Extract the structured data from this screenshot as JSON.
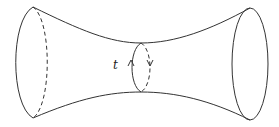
{
  "diagram": {
    "loop_label": "t",
    "stroke_color": "#333333",
    "background": "#ffffff"
  }
}
